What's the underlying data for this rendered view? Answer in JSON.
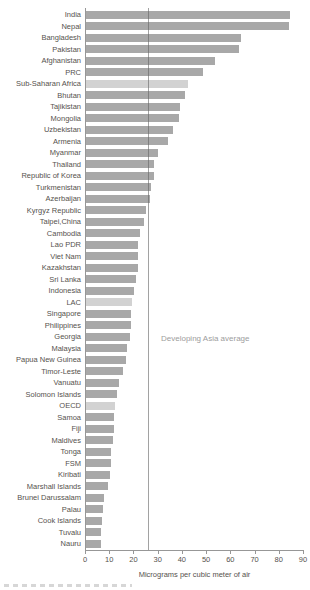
{
  "chart_data": {
    "type": "bar",
    "orientation": "horizontal",
    "title": "",
    "xlabel": "Micrograms per cubic meter of air",
    "ylabel": "",
    "xlim": [
      0,
      90
    ],
    "x_ticks": [
      0,
      10,
      20,
      30,
      40,
      50,
      60,
      70,
      80,
      90
    ],
    "grid": false,
    "categories": [
      "India",
      "Nepal",
      "Bangladesh",
      "Pakistan",
      "Afghanistan",
      "PRC",
      "Sub-Saharan Africa",
      "Bhutan",
      "Tajikistan",
      "Mongolia",
      "Uzbekistan",
      "Armenia",
      "Myanmar",
      "Thailand",
      "Republic of Korea",
      "Turkmenistan",
      "Azerbaijan",
      "Kyrgyz Republic",
      "Taipei,China",
      "Cambodia",
      "Lao PDR",
      "Viet Nam",
      "Kazakhstan",
      "Sri Lanka",
      "Indonesia",
      "LAC",
      "Singapore",
      "Philippines",
      "Georgia",
      "Malaysia",
      "Papua New Guinea",
      "Timor-Leste",
      "Vanuatu",
      "Solomon Islands",
      "OECD",
      "Samoa",
      "Fiji",
      "Maldives",
      "Tonga",
      "FSM",
      "Kiribati",
      "Marshall Islands",
      "Brunei Darussalam",
      "Palau",
      "Cook Islands",
      "Tuvalu",
      "Nauru"
    ],
    "values": [
      84.5,
      84,
      64,
      63.5,
      53.5,
      48.5,
      42,
      41,
      39,
      38.5,
      36,
      34,
      30,
      28,
      28,
      27,
      26.5,
      25,
      24,
      22.5,
      21.5,
      21.5,
      21.5,
      20.5,
      20,
      19,
      18.5,
      18.5,
      18,
      17,
      16.5,
      15.5,
      13.5,
      13,
      12,
      11.5,
      11.5,
      11,
      10.5,
      10.5,
      10,
      9,
      7.5,
      7,
      6.5,
      6,
      6
    ],
    "comparator_categories": [
      "Sub-Saharan Africa",
      "LAC",
      "OECD"
    ],
    "reference_line": {
      "label": "Developing Asia average",
      "value": 26
    },
    "colors": {
      "bar": "#a8a8a8",
      "comparator_bar": "#d2d2d2",
      "axis": "#979797",
      "reference_line": "#6f6f6f",
      "label_text": "#56524e",
      "reference_label_text": "#9d9d9d"
    }
  }
}
